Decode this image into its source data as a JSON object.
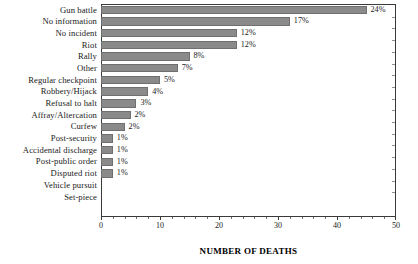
{
  "chart_data": {
    "type": "bar",
    "orientation": "horizontal",
    "title": "",
    "xlabel": "NUMBER OF DEATHS",
    "ylabel": "",
    "xlim": [
      0,
      50
    ],
    "xticks": [
      0,
      10,
      20,
      30,
      40,
      50
    ],
    "xtick_labels": [
      "0",
      "10",
      "20",
      "30",
      "40",
      "50"
    ],
    "grid": false,
    "legend": false,
    "bar_color": "#8a8a8a",
    "categories": [
      "Gun battle",
      "No information",
      "No incident",
      "Riot",
      "Rally",
      "Other",
      "Regular checkpoint",
      "Robbery/Hijack",
      "Refusal to halt",
      "Affray/Altercation",
      "Curfew",
      "Post-security",
      "Accidental discharge",
      "Post-public order",
      "Disputed riot",
      "Vehicle pursuit",
      "Set-piece"
    ],
    "values": [
      45,
      32,
      23,
      23,
      15,
      13,
      10,
      8,
      6,
      5,
      4,
      2,
      2,
      2,
      2,
      0,
      0
    ],
    "data_labels": [
      "24%",
      "17%",
      "12%",
      "12%",
      "8%",
      "7%",
      "5%",
      "4%",
      "3%",
      "2%",
      "2%",
      "1%",
      "1%",
      "1%",
      "1%",
      "",
      ""
    ]
  }
}
